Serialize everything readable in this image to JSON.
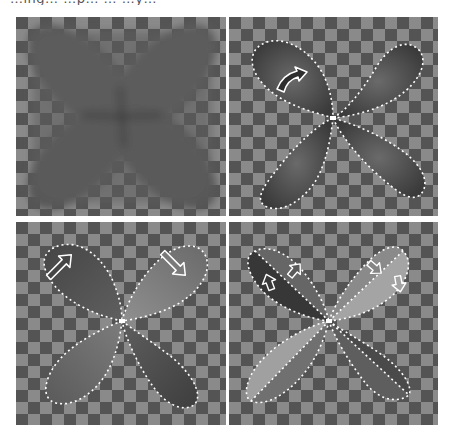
{
  "figure": {
    "caption_cutoff": "…ing… …p… … …y…",
    "colors": {
      "checker_dark": "#545454",
      "checker_light": "#8a8a8a",
      "lobe_dark": "#3c3c3c",
      "lobe_mid": "#5e5e5e",
      "lobe_light": "#9a9a9a",
      "outline": "#ffffff",
      "divider": "#ffffff"
    },
    "panels": [
      {
        "id": "top-left",
        "label": "blurred four-lobe shape",
        "outlined": false,
        "arrows": []
      },
      {
        "id": "top-right",
        "label": "outlined lobes with rotation arrow",
        "outlined": true,
        "arrows": [
          "curved-arrow"
        ]
      },
      {
        "id": "bottom-left",
        "label": "outlined lobes with direction arrows",
        "outlined": true,
        "arrows": [
          "arrow-up-right",
          "arrow-down-right"
        ]
      },
      {
        "id": "bottom-right",
        "label": "split lobes with small arrows",
        "outlined": true,
        "arrows": [
          "arrow-up",
          "arrow-up",
          "arrow-down",
          "arrow-down"
        ]
      }
    ]
  }
}
